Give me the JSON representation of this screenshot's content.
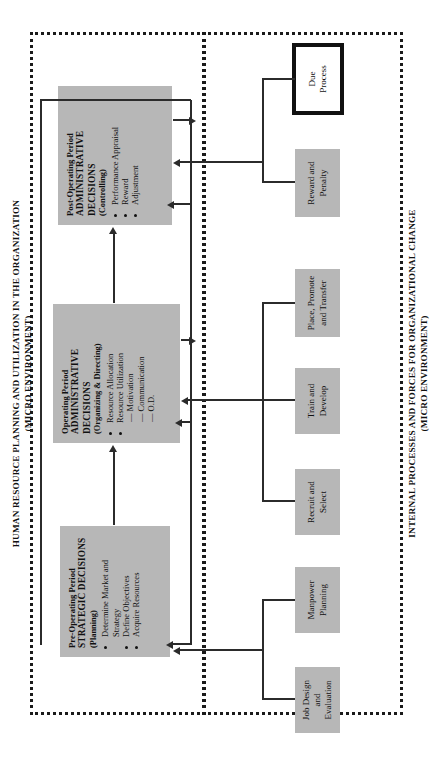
{
  "diagram": {
    "orientation": "rotated-90-ccw",
    "accent_gray": "#b7b7b7",
    "line_color": "#2b2b2b",
    "bands": {
      "top": {
        "title": "HUMAN RESOURCE PLANNING AND UTILIZATION IN THE ORGANIZATION\n(MICRO ENVIRONMENT)"
      },
      "bottom": {
        "title": "INTERNAL PROCESSES AND FORCES FOR ORGANIZATIONAL CHANGE\n(MICRO ENVIRONMENT)"
      }
    },
    "main_boxes": [
      {
        "id": "pre-operating",
        "line1": "Pre-Operating Period",
        "line2": "STRATEGIC DECISIONS",
        "line3": "(Planning)",
        "bullets": [
          "Determine Market and Strategy",
          "Define Objectives",
          "Acquire Resources"
        ],
        "dashes": []
      },
      {
        "id": "operating",
        "line1": "Operating Period",
        "line2": "ADMINISTRATIVE DECISIONS",
        "line3": "(Organizing & Directing)",
        "bullets": [
          "Resource Allocation",
          "Resource Utilization"
        ],
        "dashes": [
          "Motivation",
          "Communication",
          "O.D."
        ]
      },
      {
        "id": "post-operating",
        "line1": "Post-Operating Period",
        "line2": "ADMINISTRATIVE DECISIONS",
        "line3": "(Controlling)",
        "bullets": [
          "Performance Appraisal",
          "Reward",
          "Adjustment"
        ],
        "dashes": []
      }
    ],
    "process_boxes": [
      {
        "id": "job-design",
        "label": "Job Design\nand\nEvaluation",
        "style": "gray"
      },
      {
        "id": "manpower-planning",
        "label": "Manpower\nPlanning",
        "style": "gray"
      },
      {
        "id": "recruit-select",
        "label": "Recruit and\nSelect",
        "style": "gray"
      },
      {
        "id": "train-develop",
        "label": "Train and\nDevelop",
        "style": "gray"
      },
      {
        "id": "place-promote",
        "label": "Place, Promote\nand Transfer",
        "style": "gray"
      },
      {
        "id": "reward-penalty",
        "label": "Reward and\nPenalty",
        "style": "gray"
      },
      {
        "id": "due-process",
        "label": "Due\nProcess",
        "style": "outlined-white"
      }
    ]
  }
}
